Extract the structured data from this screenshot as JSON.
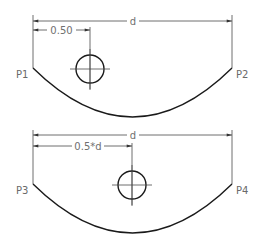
{
  "colors": {
    "background": "#ffffff",
    "geometry": "#1a1a1a",
    "dimension": "#4a4a4a",
    "text": "#6a6a6a"
  },
  "figures": [
    {
      "name": "fixed-offset-part",
      "dimensions": {
        "overall_width_label": "d",
        "hole_offset_label": "0.50"
      },
      "points": {
        "left": "P1",
        "right": "P2"
      }
    },
    {
      "name": "parametric-offset-part",
      "dimensions": {
        "overall_width_label": "d",
        "hole_offset_label": "0.5*d"
      },
      "points": {
        "left": "P3",
        "right": "P4"
      }
    }
  ]
}
